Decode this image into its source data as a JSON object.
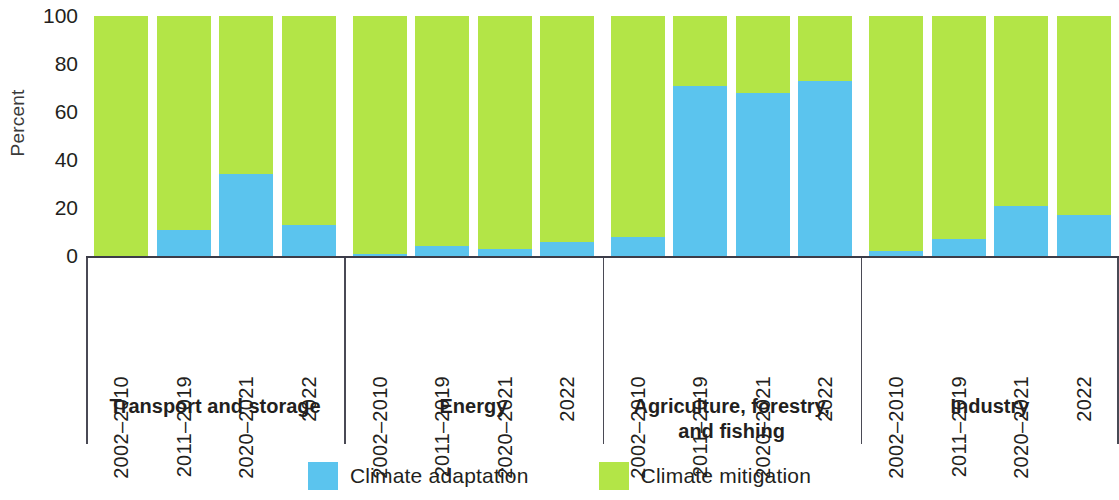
{
  "axis": {
    "y_title": "Percent",
    "y_ticks": [
      0,
      20,
      40,
      60,
      80,
      100
    ],
    "y_min": 0,
    "y_max": 100
  },
  "legend": {
    "items": [
      {
        "label": "Climate adaptation",
        "color": "#5bc4ee"
      },
      {
        "label": "Climate mitigation",
        "color": "#b3e547"
      }
    ]
  },
  "groups": [
    {
      "title": "Transport and storage",
      "title_line1": "Transport and storage",
      "title_line2": "",
      "categories": [
        "2002–2010",
        "2011–2019",
        "2020–2021",
        "2022"
      ]
    },
    {
      "title": "Energy",
      "title_line1": "Energy",
      "title_line2": "",
      "categories": [
        "2002–2010",
        "2011–2019",
        "2020–2021",
        "2022"
      ]
    },
    {
      "title": "Agriculture, forestry, and fishing",
      "title_line1": "Agriculture, forestry,",
      "title_line2": "and fishing",
      "categories": [
        "2002–2010",
        "2011–2019",
        "2020–2021",
        "2022"
      ]
    },
    {
      "title": "Industry",
      "title_line1": "Industry",
      "title_line2": "",
      "categories": [
        "2002–2010",
        "2011–2019",
        "2020–2021",
        "2022"
      ]
    }
  ],
  "chart_data": {
    "type": "bar",
    "title": "",
    "subtitle": "",
    "xlabel": "",
    "ylabel": "Percent",
    "ylim": [
      0,
      100
    ],
    "yticks": [
      0,
      20,
      40,
      60,
      80,
      100
    ],
    "grid": false,
    "stacked": true,
    "stack_total": 100,
    "legend_position": "bottom",
    "group_labels": [
      "Transport and storage",
      "Energy",
      "Agriculture, forestry, and fishing",
      "Industry"
    ],
    "categories": [
      "2002–2010",
      "2011–2019",
      "2020–2021",
      "2022"
    ],
    "series": [
      {
        "name": "Climate adaptation",
        "color": "#5bc4ee",
        "values_by_group": {
          "Transport and storage": [
            0,
            11,
            34,
            13
          ],
          "Energy": [
            1,
            4,
            3,
            6
          ],
          "Agriculture, forestry, and fishing": [
            8,
            71,
            68,
            73
          ],
          "Industry": [
            2,
            7,
            21,
            17
          ]
        }
      },
      {
        "name": "Climate mitigation",
        "color": "#b3e547",
        "values_by_group": {
          "Transport and storage": [
            100,
            89,
            66,
            87
          ],
          "Energy": [
            99,
            96,
            97,
            94
          ],
          "Agriculture, forestry, and fishing": [
            92,
            29,
            32,
            27
          ],
          "Industry": [
            98,
            93,
            79,
            83
          ]
        }
      }
    ]
  }
}
